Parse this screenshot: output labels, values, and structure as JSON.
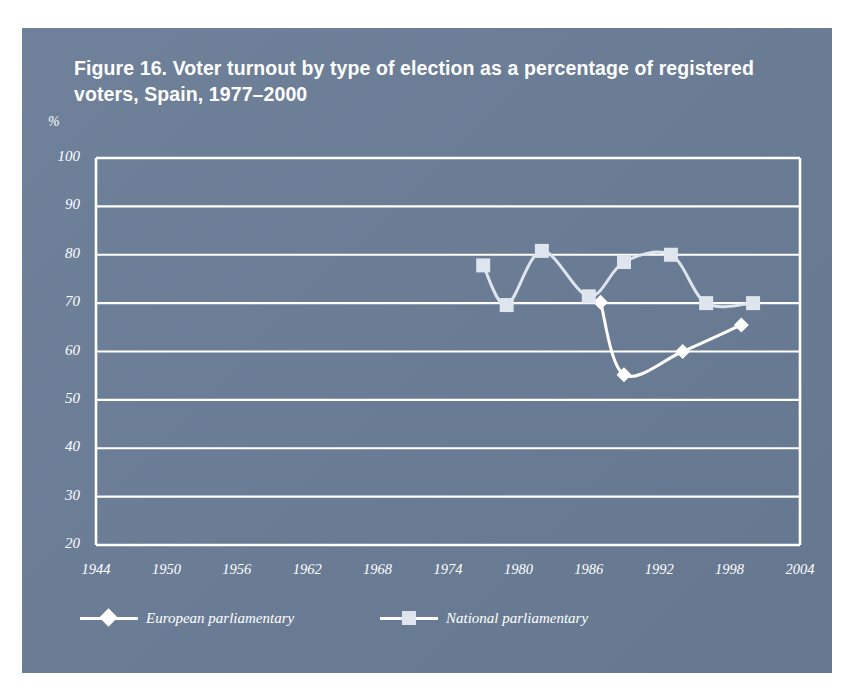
{
  "figure": {
    "title": "Figure 16. Voter turnout by type of election as a percentage of registered voters, Spain, 1977–2000"
  },
  "colors": {
    "panel_background": "#6a7c96",
    "page_background": "#ffffff",
    "axis": "#ffffff",
    "gridline": "#ffffff",
    "series_european": "#ffffff",
    "series_national": "#dfe5ee",
    "text": "#ffffff"
  },
  "chart_data": {
    "type": "line",
    "title": "Figure 16. Voter turnout by type of election as a percentage of registered voters, Spain, 1977–2000",
    "xlabel": "",
    "ylabel": "%",
    "y_unit_label": "%",
    "xlim": [
      1944,
      2004
    ],
    "ylim": [
      20,
      100
    ],
    "yticks": [
      20,
      30,
      40,
      50,
      60,
      70,
      80,
      90,
      100
    ],
    "ytick_labels": [
      "20",
      "30",
      "40",
      "50",
      "60",
      "70",
      "80",
      "90",
      "100"
    ],
    "xticks": [
      1944,
      1950,
      1956,
      1962,
      1968,
      1974,
      1980,
      1986,
      1992,
      1998,
      2004
    ],
    "xtick_labels": [
      "1944",
      "1950",
      "1956",
      "1962",
      "1968",
      "1974",
      "1980",
      "1986",
      "1992",
      "1998",
      "2004"
    ],
    "grid": true,
    "grid_axis": "y",
    "legend_position": "bottom",
    "series": [
      {
        "name": "European parliamentary",
        "marker": "diamond",
        "color": "#ffffff",
        "x": [
          1987,
          1989,
          1994,
          1999
        ],
        "values": [
          70.2,
          55.2,
          60.0,
          65.5
        ]
      },
      {
        "name": "National parliamentary",
        "marker": "square",
        "color": "#dfe5ee",
        "x": [
          1977,
          1979,
          1982,
          1986,
          1989,
          1993,
          1996,
          2000
        ],
        "values": [
          77.8,
          69.6,
          80.8,
          71.4,
          78.5,
          80.0,
          70.0,
          70.0
        ]
      }
    ]
  },
  "legend": {
    "entries": [
      {
        "label": "European parliamentary",
        "marker": "diamond"
      },
      {
        "label": "National parliamentary",
        "marker": "square"
      }
    ]
  }
}
